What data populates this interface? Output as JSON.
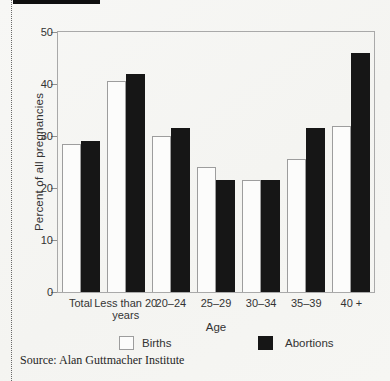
{
  "page": {
    "source_caption": "Source: Alan Guttmacher Institute"
  },
  "chart_data": {
    "type": "bar",
    "title": "",
    "categories": [
      "Total",
      "Less than 20 years",
      "20–24",
      "25–29",
      "30–34",
      "35–39",
      "40 +"
    ],
    "series": [
      {
        "name": "Births",
        "color": "#fcfcfb",
        "values": [
          28.5,
          40.5,
          30.0,
          24.0,
          21.5,
          25.5,
          32.0
        ]
      },
      {
        "name": "Abortions",
        "color": "#161616",
        "values": [
          29.0,
          42.0,
          31.5,
          21.5,
          21.5,
          31.5,
          46.0
        ]
      }
    ],
    "xlabel": "Age",
    "ylabel": "Percent of all pregnancies",
    "ylim": [
      0,
      50
    ],
    "yticks": [
      0,
      10,
      20,
      30,
      40,
      50
    ],
    "grid": false,
    "legend_position": "bottom"
  }
}
